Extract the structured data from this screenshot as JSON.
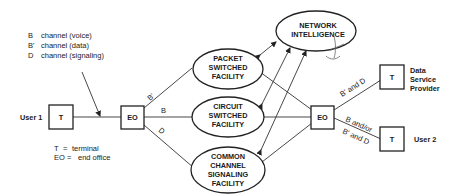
{
  "legend": {
    "channels": [
      {
        "code": "B",
        "desc": "channel (voice)"
      },
      {
        "code": "B'",
        "desc": "channel (data)"
      },
      {
        "code": "D",
        "desc": "channel (signaling)"
      }
    ],
    "abbreviations": [
      {
        "abbr": "T",
        "eq": "=",
        "desc": "terminal"
      },
      {
        "abbr": "EO",
        "eq": "=",
        "desc": "end office"
      }
    ]
  },
  "nodes": {
    "user1_label": "User 1",
    "terminal1": "T",
    "eo_left": "EO",
    "eo_right": "EO",
    "terminal_dsp": "T",
    "terminal_user2": "T",
    "dsp_label": [
      "Data",
      "Service",
      "Provider"
    ],
    "user2_label": "User 2",
    "network_intelligence": [
      "NETWORK",
      "INTELLIGENCE"
    ],
    "packet_facility": [
      "PACKET",
      "SWITCHED",
      "FACILITY"
    ],
    "circuit_facility": [
      "CIRCUIT",
      "SWITCHED",
      "FACILITY"
    ],
    "ccs_facility": [
      "COMMON",
      "CHANNEL",
      "SIGNALING",
      "FACILITY"
    ]
  },
  "links": {
    "left_bprime": "B'",
    "left_b": "B",
    "left_d": "D",
    "right_to_dsp": "B' and D",
    "right_to_user2_top": "B and/or",
    "right_to_user2_bottom": "B' and D"
  }
}
